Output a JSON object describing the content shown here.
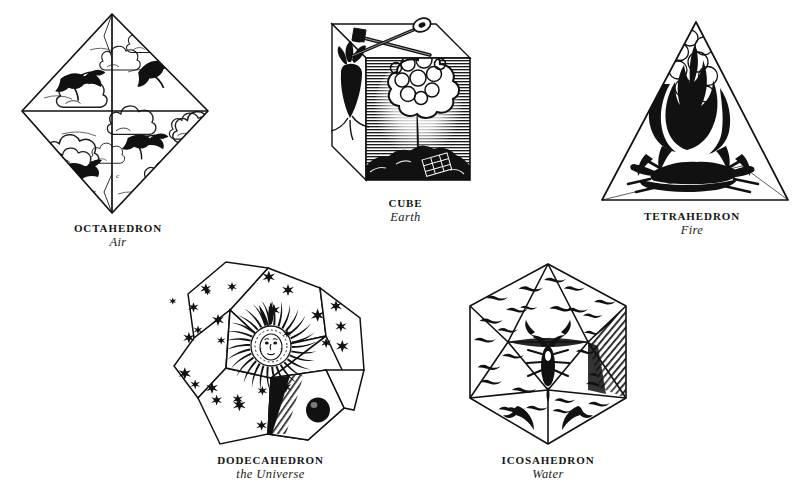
{
  "plate": {
    "title": "The Five Platonic Solids and Their Elements",
    "background_color": "#ffffff",
    "ink_color": "#111111",
    "style": "engraving"
  },
  "figures": [
    {
      "id": "octahedron",
      "name": "OCTAHEDRON",
      "element": "Air",
      "shape": "octahedron",
      "motifs": [
        "birds",
        "clouds"
      ],
      "position": {
        "x": 8,
        "y": 6
      }
    },
    {
      "id": "cube",
      "name": "CUBE",
      "element": "Earth",
      "shape": "cube",
      "motifs": [
        "tree",
        "mound",
        "carrot",
        "hoe",
        "spade"
      ],
      "position": {
        "x": 318,
        "y": 6
      }
    },
    {
      "id": "tetrahedron",
      "name": "TETRAHEDRON",
      "element": "Fire",
      "shape": "tetrahedron",
      "motifs": [
        "flames",
        "burning-logs",
        "smoke"
      ],
      "position": {
        "x": 592,
        "y": 14
      }
    },
    {
      "id": "dodecahedron",
      "name": "DODECAHEDRON",
      "element": "the Universe",
      "shape": "dodecahedron",
      "motifs": [
        "sun-with-face",
        "stars",
        "moon-disc"
      ],
      "position": {
        "x": 168,
        "y": 258
      }
    },
    {
      "id": "icosahedron",
      "name": "ICOSAHEDRON",
      "element": "Water",
      "shape": "icosahedron",
      "motifs": [
        "waves",
        "crab",
        "dolphins"
      ],
      "position": {
        "x": 448,
        "y": 258
      }
    }
  ]
}
